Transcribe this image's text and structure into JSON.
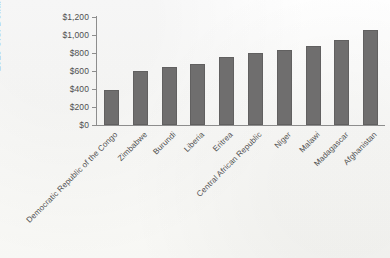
{
  "chart_data": {
    "type": "bar",
    "title": "",
    "xlabel": "",
    "ylabel": "2013 U.S. Dollars",
    "ylim": [
      0,
      1200
    ],
    "ytick_step": 200,
    "ytick_labels": [
      "$1,200",
      "$1,000",
      "$800",
      "$600",
      "$400",
      "$200",
      "$0"
    ],
    "ytick_values": [
      1200,
      1000,
      800,
      600,
      400,
      200,
      0
    ],
    "grid": false,
    "legend": null,
    "bar_color": "#6f6e6e",
    "categories": [
      "Democratic Republic of the Congo",
      "Zimbabwe",
      "Burundi",
      "Liberia",
      "Eritrea",
      "Central African Republic",
      "Niger",
      "Malawi",
      "Madagascar",
      "Afghanistan"
    ],
    "values": [
      390,
      600,
      640,
      680,
      755,
      800,
      835,
      880,
      945,
      1060
    ]
  }
}
